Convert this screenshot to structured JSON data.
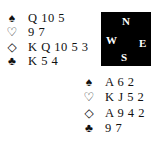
{
  "compass": {
    "north": "N",
    "west": "W",
    "east": "E",
    "south": "S"
  },
  "west_hand": {
    "spades": {
      "symbol": "♠",
      "cards": "Q 10 5"
    },
    "hearts": {
      "symbol": "♡",
      "cards": "9 7"
    },
    "diamonds": {
      "symbol": "◇",
      "cards": "K Q 10 5 3"
    },
    "clubs": {
      "symbol": "♣",
      "cards": "K 5 4"
    }
  },
  "south_hand": {
    "spades": {
      "symbol": "♠",
      "cards": "A 6 2"
    },
    "hearts": {
      "symbol": "♡",
      "cards": "K J 5 2"
    },
    "diamonds": {
      "symbol": "◇",
      "cards": "A 9 4 2"
    },
    "clubs": {
      "symbol": "♣",
      "cards": "9 7"
    }
  }
}
